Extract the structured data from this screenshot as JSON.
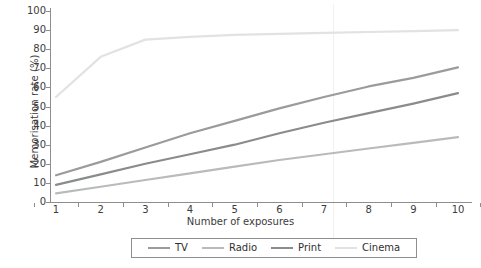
{
  "chart_data": {
    "type": "line",
    "title": "",
    "xlabel": "Number of exposures",
    "ylabel": "Memorisation rate (%)",
    "x": [
      1,
      2,
      3,
      4,
      5,
      6,
      7,
      8,
      9,
      10
    ],
    "xlim": [
      1,
      10
    ],
    "ylim": [
      0,
      100
    ],
    "xticks": [
      "1",
      "2",
      "3",
      "4",
      "5",
      "6",
      "7",
      "8",
      "9",
      "10"
    ],
    "yticks": [
      "0",
      "10",
      "20",
      "30",
      "40",
      "50",
      "60",
      "70",
      "80",
      "90",
      "100"
    ],
    "grid": false,
    "legend_position": "below",
    "series": [
      {
        "name": "TV",
        "color": "#9a9b9b",
        "values": [
          14,
          21,
          28.5,
          36,
          42.5,
          49,
          55,
          60.5,
          65,
          70.5
        ]
      },
      {
        "name": "Radio",
        "color": "#b9bbbb",
        "values": [
          4.5,
          8,
          11.5,
          15,
          18.5,
          22,
          25,
          28,
          31,
          34
        ]
      },
      {
        "name": "Print",
        "color": "#8a8c8c",
        "values": [
          9,
          14.5,
          20,
          25,
          30,
          36,
          41.5,
          46.5,
          51.5,
          57
        ]
      },
      {
        "name": "Cinema",
        "color": "#e2e2e2",
        "values": [
          55,
          76,
          85,
          86.5,
          87.5,
          88,
          88.5,
          89,
          89.5,
          90
        ]
      }
    ]
  },
  "axes": {
    "spine_color": "#8e8e8e",
    "tick_color": "#8e8e8e"
  },
  "legend": {
    "entries": [
      "TV",
      "Radio",
      "Print",
      "Cinema"
    ]
  }
}
